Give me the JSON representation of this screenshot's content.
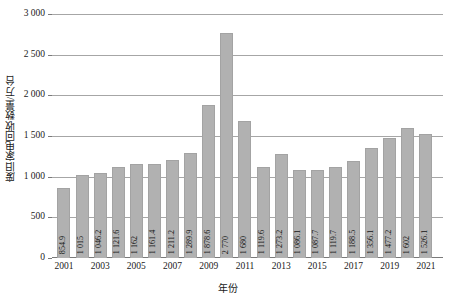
{
  "chart_data": {
    "type": "bar",
    "title": "",
    "xlabel": "年份",
    "ylabel": "废旧家电回收数量/万台",
    "categories": [
      "2001",
      "2002",
      "2003",
      "2004",
      "2005",
      "2006",
      "2007",
      "2008",
      "2009",
      "2010",
      "2011",
      "2012",
      "2013",
      "2014",
      "2015",
      "2016",
      "2017",
      "2018",
      "2019",
      "2020",
      "2021"
    ],
    "values": [
      854.9,
      1015,
      1046.2,
      1121.6,
      1162,
      1161.4,
      1211.2,
      1289.9,
      1878.6,
      2770,
      1680,
      1119.6,
      1273.2,
      1086.1,
      1087.7,
      1119.7,
      1188.5,
      1356.1,
      1477.2,
      1602,
      1526.1
    ],
    "data_labels": [
      "854.9",
      "1 015",
      "1 046.2",
      "1 121.6",
      "1 162",
      "1 161.4",
      "1 211.2",
      "1 289.9",
      "1 878.6",
      "2 770",
      "1 680",
      "1 119.6",
      "1 273.2",
      "1 086.1",
      "1 087.7",
      "1 119.7",
      "1 188.5",
      "1 356.1",
      "1 477.2",
      "1 602",
      "1 526.1"
    ],
    "ylim": [
      0,
      3000
    ],
    "y_ticks": [
      0,
      500,
      1000,
      1500,
      2000,
      2500,
      3000
    ],
    "y_tick_labels": [
      "0",
      "500",
      "1 000",
      "1 500",
      "2 000",
      "2 500",
      "3 000"
    ],
    "x_tick_labels": [
      "2001",
      "2003",
      "2005",
      "2007",
      "2009",
      "2011",
      "2013",
      "2015",
      "2017",
      "2019",
      "2021"
    ],
    "x_tick_categories": [
      "2001",
      "2003",
      "2005",
      "2007",
      "2009",
      "2011",
      "2013",
      "2015",
      "2017",
      "2019",
      "2021"
    ],
    "grid": true,
    "legend": "none",
    "bar_color": "#b1b1b1",
    "grid_color": "#a6a6a6",
    "axis_color": "#7a7a7a",
    "text_color": "#1a1a1a"
  }
}
